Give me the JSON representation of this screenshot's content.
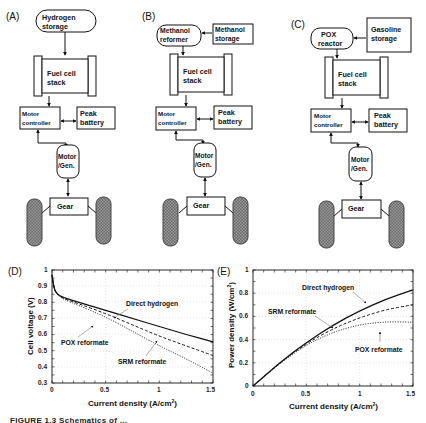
{
  "panels": {
    "A": {
      "label": "(A)",
      "source": {
        "line1": "Hydrogen",
        "line2": "storage"
      },
      "stack": {
        "line1": "Fuel cell",
        "line2": "stack"
      },
      "controller": {
        "line1": "Motor",
        "line2": "controller"
      },
      "battery": {
        "line1": "Peak",
        "line2": "battery"
      },
      "motor": {
        "line1": "Motor",
        "line2": "/Gen."
      },
      "gear": "Gear"
    },
    "B": {
      "label": "(B)",
      "reformer": {
        "line1": "Methanol",
        "line2": "reformer"
      },
      "storage": {
        "line1": "Methanol",
        "line2": "storage"
      },
      "stack": {
        "line1": "Fuel cell",
        "line2": "stack"
      },
      "controller": {
        "line1": "Motor",
        "line2": "controller"
      },
      "battery": {
        "line1": "Peak",
        "line2": "battery"
      },
      "motor": {
        "line1": "Motor",
        "line2": "/Gen."
      },
      "gear": "Gear"
    },
    "C": {
      "label": "(C)",
      "reactor": {
        "line1": "POX",
        "line2": "reactor"
      },
      "storage": {
        "line1": "Gasoline",
        "line2": "storage"
      },
      "stack": {
        "line1": "Fuel cell",
        "line2": "stack"
      },
      "controller": {
        "line1": "Motor",
        "line2": "controller"
      },
      "battery": {
        "line1": "Peak",
        "line2": "battery"
      },
      "motor": {
        "line1": "Motor",
        "line2": "/Gen."
      },
      "gear": "Gear"
    },
    "D": {
      "label": "(D)"
    },
    "E": {
      "label": "(E)"
    }
  },
  "caption": "FIGURE 1.3  Schematics of ...",
  "chart_data": [
    {
      "type": "line",
      "panel": "D",
      "title": "",
      "xlabel": "Current density (A/cm²)",
      "ylabel": "Cell voltage (V)",
      "xlim": [
        0,
        1.5
      ],
      "ylim": [
        0.3,
        1.0
      ],
      "xticks": [
        "0",
        "0.5",
        "1",
        "1.5"
      ],
      "yticks": [
        "0.3",
        "0.4",
        "0.5",
        "0.6",
        "0.7",
        "0.8",
        "0.9",
        "1"
      ],
      "grid": true,
      "x": [
        0,
        0.02,
        0.05,
        0.1,
        0.25,
        0.5,
        0.75,
        1.0,
        1.25,
        1.5
      ],
      "series": [
        {
          "name": "Direct hydrogen",
          "style": "solid",
          "values": [
            0.97,
            0.88,
            0.85,
            0.83,
            0.8,
            0.75,
            0.7,
            0.65,
            0.6,
            0.555
          ]
        },
        {
          "name": "SRM reformate",
          "style": "dashed",
          "values": [
            0.97,
            0.88,
            0.85,
            0.825,
            0.79,
            0.73,
            0.66,
            0.59,
            0.53,
            0.47
          ]
        },
        {
          "name": "POX reformate",
          "style": "dotted",
          "values": [
            0.97,
            0.88,
            0.85,
            0.82,
            0.78,
            0.71,
            0.62,
            0.53,
            0.45,
            0.36
          ]
        }
      ],
      "annotations": [
        "Direct hydrogen",
        "POX reformate",
        "SRM reformate"
      ]
    },
    {
      "type": "line",
      "panel": "E",
      "title": "",
      "xlabel": "Current density (A/cm²)",
      "ylabel": "Power density (W/cm²)",
      "xlim": [
        0,
        1.5
      ],
      "ylim": [
        0,
        1.0
      ],
      "xticks": [
        "0",
        "0.5",
        "1",
        "1.5"
      ],
      "yticks": [
        "0",
        "0.2",
        "0.4",
        "0.6",
        "0.8",
        "1"
      ],
      "grid": true,
      "x": [
        0,
        0.25,
        0.5,
        0.75,
        1.0,
        1.25,
        1.5
      ],
      "series": [
        {
          "name": "Direct hydrogen",
          "style": "solid",
          "values": [
            0,
            0.2,
            0.375,
            0.525,
            0.65,
            0.75,
            0.83
          ]
        },
        {
          "name": "SRM reformate",
          "style": "dashed",
          "values": [
            0,
            0.2,
            0.365,
            0.495,
            0.59,
            0.66,
            0.7
          ]
        },
        {
          "name": "POX reformate",
          "style": "dotted",
          "values": [
            0,
            0.195,
            0.355,
            0.465,
            0.53,
            0.555,
            0.55
          ]
        }
      ],
      "annotations": [
        "Direct hydrogen",
        "SRM reformate",
        "POX reformate"
      ]
    }
  ]
}
